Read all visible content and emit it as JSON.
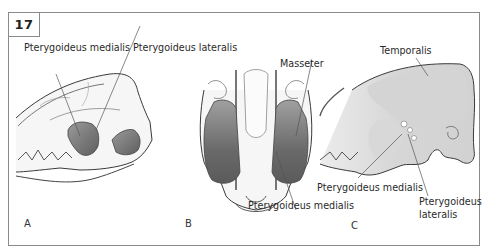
{
  "figure": {
    "number": "17",
    "panels": [
      {
        "id": "A",
        "letter": "A",
        "view": "lateral skull",
        "labels": {
          "medialis": "Pterygoideus medialis",
          "lateralis": "Pterygoideus lateralis"
        }
      },
      {
        "id": "B",
        "letter": "B",
        "view": "ventral skull",
        "labels": {
          "masseter": "Masseter",
          "medialis": "Pterygoideus medialis"
        }
      },
      {
        "id": "C",
        "letter": "C",
        "view": "lateral skull (deep)",
        "labels": {
          "temporalis": "Temporalis",
          "medialis": "Pterygoideus medialis",
          "lateralis_line1": "Pterygoideus",
          "lateralis_line2": "lateralis"
        }
      }
    ]
  },
  "colors": {
    "frame": "#8a8a8a",
    "outline": "#3a3a3a",
    "muscle_dark": "#6e6e6e",
    "muscle_mid": "#9a9a9a",
    "muscle_light": "#d9d9d9",
    "bone_fill": "#f4f4f4"
  }
}
